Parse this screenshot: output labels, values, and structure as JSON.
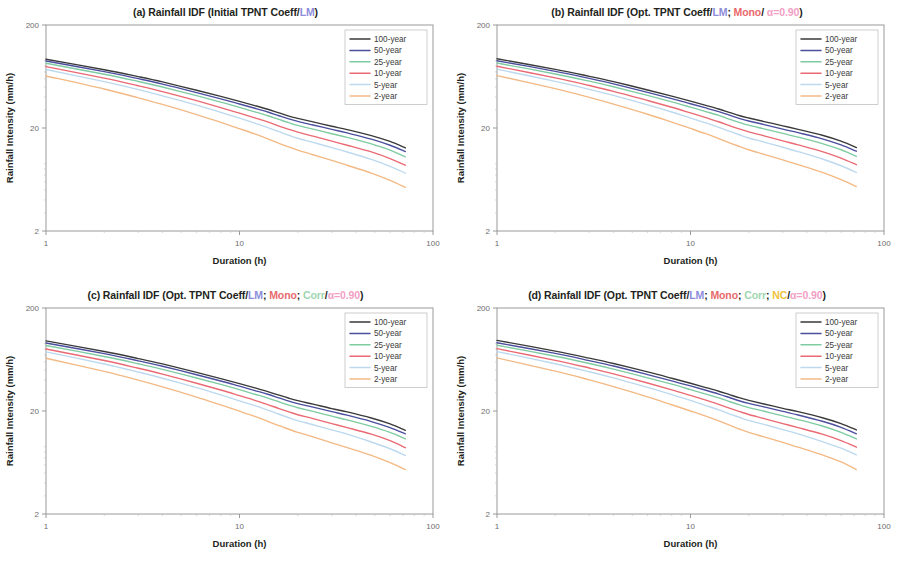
{
  "figure": {
    "panels": [
      {
        "id": "a",
        "label": "(a)",
        "title_plain": "(a) Rainfall IDF (Initial TPNT Coeff/LM)",
        "title_parts": [
          {
            "text": "(a) Rainfall IDF (Initial TPNT Coeff/",
            "color": "#231f20"
          },
          {
            "text": "LM",
            "color": "#8d8ddb"
          },
          {
            "text": ")",
            "color": "#231f20"
          }
        ]
      },
      {
        "id": "b",
        "label": "(b)",
        "title_plain": "(b) Rainfall IDF (Opt. TPNT Coeff/LM; Mono/ α=0.90)",
        "title_parts": [
          {
            "text": "(b) Rainfall IDF (Opt. TPNT Coeff/",
            "color": "#231f20"
          },
          {
            "text": "LM",
            "color": "#8d8ddb"
          },
          {
            "text": "; ",
            "color": "#231f20"
          },
          {
            "text": "Mono",
            "color": "#e8696b"
          },
          {
            "text": "/ ",
            "color": "#231f20"
          },
          {
            "text": "α=0.90",
            "color": "#f2a0c4"
          },
          {
            "text": ")",
            "color": "#231f20"
          }
        ]
      },
      {
        "id": "c",
        "label": "(c)",
        "title_plain": "(c) Rainfall IDF (Opt. TPNT Coeff/LM; Mono; Corr/α=0.90)",
        "title_parts": [
          {
            "text": "(c) Rainfall IDF (Opt. TPNT Coeff/",
            "color": "#231f20"
          },
          {
            "text": "LM",
            "color": "#8d8ddb"
          },
          {
            "text": "; ",
            "color": "#231f20"
          },
          {
            "text": "Mono",
            "color": "#e8696b"
          },
          {
            "text": "; ",
            "color": "#231f20"
          },
          {
            "text": "Corr",
            "color": "#9ed6b0"
          },
          {
            "text": "/",
            "color": "#231f20"
          },
          {
            "text": "α=0.90",
            "color": "#f2a0c4"
          },
          {
            "text": ")",
            "color": "#231f20"
          }
        ]
      },
      {
        "id": "d",
        "label": "(d)",
        "title_plain": "(d) Rainfall IDF (Opt. TPNT Coeff/LM; Mono; Corr; NC/α=0.90)",
        "title_parts": [
          {
            "text": "(d) Rainfall IDF (Opt. TPNT Coeff/",
            "color": "#231f20"
          },
          {
            "text": "LM",
            "color": "#8d8ddb"
          },
          {
            "text": "; ",
            "color": "#231f20"
          },
          {
            "text": "Mono",
            "color": "#e8696b"
          },
          {
            "text": "; ",
            "color": "#231f20"
          },
          {
            "text": "Corr",
            "color": "#9ed6b0"
          },
          {
            "text": "; ",
            "color": "#231f20"
          },
          {
            "text": "NC",
            "color": "#f0c23c"
          },
          {
            "text": "/",
            "color": "#231f20"
          },
          {
            "text": "α=0.90",
            "color": "#f2a0c4"
          },
          {
            "text": ")",
            "color": "#231f20"
          }
        ]
      }
    ]
  },
  "chart_data": [
    {
      "type": "line",
      "panel": "a",
      "title": "(a) Rainfall IDF (Initial TPNT Coeff/LM)",
      "xlabel": "Duration (h)",
      "ylabel": "Rainfall Intensity (mm/h)",
      "xscale": "log",
      "yscale": "log",
      "xlim": [
        1,
        100
      ],
      "ylim": [
        2,
        200
      ],
      "xticks": [
        1,
        10,
        100
      ],
      "xticklabels": [
        "1",
        "10",
        "100"
      ],
      "yticks": [
        2,
        20,
        200
      ],
      "yticklabels": [
        "2",
        "20",
        "200"
      ],
      "grid": false,
      "legend_position": "top-right",
      "x": [
        1,
        2,
        3,
        4,
        6,
        8,
        10,
        12,
        14,
        16,
        18,
        20,
        24,
        30,
        36,
        48,
        60,
        72
      ],
      "series": [
        {
          "name": "100-year",
          "color": "#3a3a3a",
          "values": [
            93.0,
            73.5,
            63.0,
            56.0,
            46.5,
            40.5,
            36.2,
            33.0,
            30.4,
            28.0,
            26.1,
            24.8,
            22.9,
            20.8,
            19.3,
            16.9,
            14.8,
            12.8
          ]
        },
        {
          "name": "50-year",
          "color": "#4b4f9e",
          "values": [
            89.5,
            70.5,
            60.2,
            53.4,
            44.2,
            38.4,
            34.2,
            31.1,
            28.6,
            26.3,
            24.5,
            23.2,
            21.4,
            19.4,
            17.9,
            15.6,
            13.6,
            11.8
          ]
        },
        {
          "name": "25-year",
          "color": "#7fcba2",
          "values": [
            85.0,
            66.5,
            56.6,
            50.0,
            41.2,
            35.7,
            31.7,
            28.7,
            26.3,
            24.2,
            22.5,
            21.2,
            19.5,
            17.6,
            16.2,
            14.0,
            12.2,
            10.5
          ]
        },
        {
          "name": "10-year",
          "color": "#ea6a73",
          "values": [
            79.0,
            61.0,
            51.4,
            45.1,
            36.8,
            31.6,
            27.9,
            25.1,
            22.9,
            20.9,
            19.4,
            18.2,
            16.7,
            14.9,
            13.6,
            11.7,
            10.1,
            8.7
          ]
        },
        {
          "name": "5-year",
          "color": "#bcd9ef",
          "values": [
            74.0,
            56.4,
            47.2,
            41.1,
            33.3,
            28.4,
            24.9,
            22.3,
            20.2,
            18.4,
            17.0,
            15.9,
            14.5,
            12.9,
            11.7,
            9.9,
            8.5,
            7.3
          ]
        },
        {
          "name": "2-year",
          "color": "#f3b984",
          "values": [
            64.0,
            47.8,
            39.3,
            33.9,
            27.0,
            22.7,
            19.7,
            17.5,
            15.7,
            14.2,
            13.1,
            12.2,
            11.0,
            9.7,
            8.7,
            7.3,
            6.2,
            5.3
          ]
        }
      ]
    },
    {
      "type": "line",
      "panel": "b",
      "title": "(b) Rainfall IDF (Opt. TPNT Coeff/LM; Mono/ α=0.90)",
      "xlabel": "Duration (h)",
      "ylabel": "Rainfall Intensity (mm/h)",
      "xscale": "log",
      "yscale": "log",
      "xlim": [
        1,
        100
      ],
      "ylim": [
        2,
        200
      ],
      "xticks": [
        1,
        10,
        100
      ],
      "xticklabels": [
        "1",
        "10",
        "100"
      ],
      "yticks": [
        2,
        20,
        200
      ],
      "yticklabels": [
        "2",
        "20",
        "200"
      ],
      "grid": false,
      "legend_position": "top-right",
      "x": [
        1,
        2,
        3,
        4,
        6,
        8,
        10,
        12,
        14,
        16,
        18,
        20,
        24,
        30,
        36,
        48,
        60,
        72
      ],
      "series": [
        {
          "name": "100-year",
          "color": "#3a3a3a",
          "values": [
            94.0,
            74.2,
            63.5,
            56.4,
            46.8,
            40.8,
            36.5,
            33.2,
            30.6,
            28.2,
            26.3,
            25.0,
            23.1,
            21.0,
            19.4,
            17.0,
            14.9,
            12.9
          ]
        },
        {
          "name": "50-year",
          "color": "#4b4f9e",
          "values": [
            90.0,
            71.0,
            60.6,
            53.7,
            44.4,
            38.6,
            34.4,
            31.3,
            28.8,
            26.5,
            24.7,
            23.4,
            21.6,
            19.5,
            18.0,
            15.7,
            13.7,
            11.9
          ]
        },
        {
          "name": "25-year",
          "color": "#7fcba2",
          "values": [
            85.5,
            66.9,
            57.0,
            50.3,
            41.4,
            35.9,
            31.9,
            28.9,
            26.5,
            24.3,
            22.6,
            21.3,
            19.6,
            17.7,
            16.3,
            14.1,
            12.3,
            10.6
          ]
        },
        {
          "name": "10-year",
          "color": "#ea6a73",
          "values": [
            79.5,
            61.4,
            51.7,
            45.4,
            37.0,
            31.8,
            28.0,
            25.2,
            23.0,
            21.0,
            19.5,
            18.3,
            16.8,
            15.0,
            13.7,
            11.8,
            10.2,
            8.8
          ]
        },
        {
          "name": "5-year",
          "color": "#bcd9ef",
          "values": [
            74.5,
            56.8,
            47.5,
            41.4,
            33.5,
            28.6,
            25.0,
            22.4,
            20.3,
            18.5,
            17.1,
            16.0,
            14.6,
            13.0,
            11.8,
            10.0,
            8.6,
            7.4
          ]
        },
        {
          "name": "2-year",
          "color": "#f3b984",
          "values": [
            64.5,
            48.2,
            39.6,
            34.1,
            27.2,
            22.8,
            19.8,
            17.6,
            15.8,
            14.3,
            13.2,
            12.3,
            11.1,
            9.8,
            8.8,
            7.4,
            6.3,
            5.4
          ]
        }
      ]
    },
    {
      "type": "line",
      "panel": "c",
      "title": "(c) Rainfall IDF (Opt. TPNT Coeff/LM; Mono; Corr/α=0.90)",
      "xlabel": "Duration (h)",
      "ylabel": "Rainfall Intensity (mm/h)",
      "xscale": "log",
      "yscale": "log",
      "xlim": [
        1,
        100
      ],
      "ylim": [
        2,
        200
      ],
      "xticks": [
        1,
        10,
        100
      ],
      "xticklabels": [
        "1",
        "10",
        "100"
      ],
      "yticks": [
        2,
        20,
        200
      ],
      "yticklabels": [
        "2",
        "20",
        "200"
      ],
      "grid": false,
      "legend_position": "top-right",
      "x": [
        1,
        2,
        3,
        4,
        6,
        8,
        10,
        12,
        14,
        16,
        18,
        20,
        24,
        30,
        36,
        48,
        60,
        72
      ],
      "series": [
        {
          "name": "100-year",
          "color": "#3a3a3a",
          "values": [
            96.0,
            75.6,
            64.6,
            57.3,
            47.5,
            41.3,
            36.9,
            33.6,
            30.9,
            28.5,
            26.6,
            25.2,
            23.3,
            21.1,
            19.6,
            17.1,
            15.0,
            13.0
          ]
        },
        {
          "name": "50-year",
          "color": "#4b4f9e",
          "values": [
            91.5,
            72.0,
            61.4,
            54.4,
            45.0,
            39.1,
            34.8,
            31.6,
            29.1,
            26.8,
            24.9,
            23.6,
            21.8,
            19.7,
            18.2,
            15.8,
            13.8,
            12.0
          ]
        },
        {
          "name": "25-year",
          "color": "#7fcba2",
          "values": [
            86.5,
            67.6,
            57.5,
            50.8,
            41.8,
            36.2,
            32.2,
            29.1,
            26.7,
            24.5,
            22.8,
            21.5,
            19.8,
            17.8,
            16.4,
            14.2,
            12.4,
            10.7
          ]
        },
        {
          "name": "10-year",
          "color": "#ea6a73",
          "values": [
            80.0,
            61.8,
            52.0,
            45.6,
            37.2,
            32.0,
            28.2,
            25.4,
            23.1,
            21.1,
            19.6,
            18.4,
            16.9,
            15.1,
            13.8,
            11.9,
            10.3,
            8.8
          ]
        },
        {
          "name": "5-year",
          "color": "#bcd9ef",
          "values": [
            75.0,
            57.2,
            47.8,
            41.6,
            33.7,
            28.7,
            25.1,
            22.5,
            20.4,
            18.6,
            17.2,
            16.1,
            14.7,
            13.1,
            11.9,
            10.0,
            8.6,
            7.4
          ]
        },
        {
          "name": "2-year",
          "color": "#f3b984",
          "values": [
            65.0,
            48.5,
            39.9,
            34.3,
            27.3,
            22.9,
            19.9,
            17.7,
            15.9,
            14.4,
            13.3,
            12.4,
            11.2,
            9.8,
            8.8,
            7.4,
            6.3,
            5.4
          ]
        }
      ]
    },
    {
      "type": "line",
      "panel": "d",
      "title": "(d) Rainfall IDF (Opt. TPNT Coeff/LM; Mono; Corr; NC/α=0.90)",
      "xlabel": "Duration (h)",
      "ylabel": "Rainfall Intensity (mm/h)",
      "xscale": "log",
      "yscale": "log",
      "xlim": [
        1,
        100
      ],
      "ylim": [
        2,
        200
      ],
      "xticks": [
        1,
        10,
        100
      ],
      "xticklabels": [
        "1",
        "10",
        "100"
      ],
      "yticks": [
        2,
        20,
        200
      ],
      "yticklabels": [
        "2",
        "20",
        "200"
      ],
      "grid": false,
      "legend_position": "top-right",
      "x": [
        1,
        2,
        3,
        4,
        6,
        8,
        10,
        12,
        14,
        16,
        18,
        20,
        24,
        30,
        36,
        48,
        60,
        72
      ],
      "series": [
        {
          "name": "100-year",
          "color": "#3a3a3a",
          "values": [
            97.0,
            76.3,
            65.2,
            57.8,
            47.9,
            41.6,
            37.2,
            33.8,
            31.1,
            28.7,
            26.8,
            25.4,
            23.4,
            21.2,
            19.7,
            17.2,
            15.1,
            13.1
          ]
        },
        {
          "name": "50-year",
          "color": "#4b4f9e",
          "values": [
            92.0,
            72.4,
            61.7,
            54.7,
            45.2,
            39.3,
            35.0,
            31.8,
            29.2,
            26.9,
            25.0,
            23.7,
            21.9,
            19.8,
            18.3,
            15.9,
            13.9,
            12.0
          ]
        },
        {
          "name": "25-year",
          "color": "#7fcba2",
          "values": [
            87.0,
            68.0,
            57.8,
            51.0,
            42.0,
            36.4,
            32.3,
            29.2,
            26.8,
            24.6,
            22.9,
            21.6,
            19.9,
            17.9,
            16.5,
            14.3,
            12.4,
            10.7
          ]
        },
        {
          "name": "10-year",
          "color": "#ea6a73",
          "values": [
            80.5,
            62.1,
            52.3,
            45.9,
            37.4,
            32.1,
            28.3,
            25.5,
            23.2,
            21.2,
            19.7,
            18.5,
            16.9,
            15.1,
            13.8,
            11.9,
            10.3,
            8.9
          ]
        },
        {
          "name": "5-year",
          "color": "#bcd9ef",
          "values": [
            75.5,
            57.5,
            48.1,
            41.9,
            33.9,
            28.9,
            25.3,
            22.6,
            20.5,
            18.7,
            17.3,
            16.2,
            14.8,
            13.2,
            12.0,
            10.1,
            8.7,
            7.5
          ]
        },
        {
          "name": "2-year",
          "color": "#f3b984",
          "values": [
            65.5,
            48.8,
            40.1,
            34.5,
            27.4,
            23.0,
            20.0,
            17.8,
            16.0,
            14.5,
            13.3,
            12.4,
            11.2,
            9.9,
            8.9,
            7.5,
            6.4,
            5.4
          ]
        }
      ]
    }
  ]
}
